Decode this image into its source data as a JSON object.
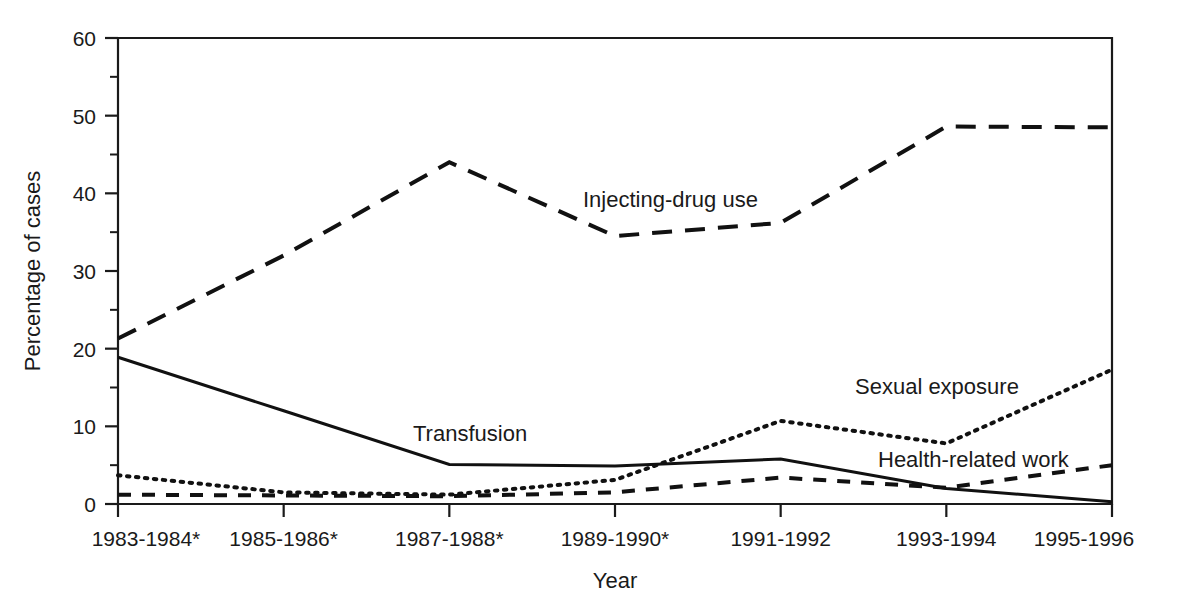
{
  "chart_data": {
    "type": "line",
    "title": "",
    "subtitle": "",
    "xlabel": "Year",
    "ylabel": "Percentage of cases",
    "categories": [
      "1983-1984*",
      "1985-1986*",
      "1987-1988*",
      "1989-1990*",
      "1991-1992",
      "1993-1994",
      "1995-1996"
    ],
    "ylim": [
      0,
      60
    ],
    "xlim_categories": 7,
    "y_ticks_major": [
      0,
      10,
      20,
      30,
      40,
      50,
      60
    ],
    "y_ticks_minor": [
      5,
      15,
      25,
      35,
      45,
      55
    ],
    "y_tick_labels": [
      "0",
      "10",
      "20",
      "30",
      "40",
      "50",
      "60"
    ],
    "grid": false,
    "legend_position": "inline-annotations",
    "footnote_marker": "*",
    "series": [
      {
        "name": "Injecting-drug use",
        "style": "long-dash",
        "color": "#111111",
        "values": [
          21.3,
          32.0,
          44.0,
          34.5,
          36.2,
          48.6,
          48.5
        ],
        "label_x_category_index": 3,
        "label_text": "Injecting-drug use"
      },
      {
        "name": "Transfusion",
        "style": "solid",
        "color": "#111111",
        "values": [
          18.9,
          12.0,
          5.1,
          4.9,
          5.8,
          2.0,
          0.3
        ],
        "label_x_category_index": 2,
        "label_text": "Transfusion"
      },
      {
        "name": "Sexual exposure",
        "style": "dotted",
        "color": "#111111",
        "values": [
          3.7,
          1.5,
          1.2,
          3.1,
          10.7,
          7.8,
          17.3
        ],
        "label_x_category_index": 5,
        "label_text": "Sexual exposure"
      },
      {
        "name": "Health-related work",
        "style": "short-dash",
        "color": "#111111",
        "values": [
          1.2,
          1.1,
          1.0,
          1.5,
          3.4,
          2.1,
          5.0
        ],
        "label_x_category_index": 5,
        "label_text": "Health-related work"
      }
    ],
    "annotations": [
      {
        "text": "Injecting-drug use",
        "x": 583,
        "y": 207
      },
      {
        "text": "Transfusion",
        "x": 413,
        "y": 441
      },
      {
        "text": "Sexual exposure",
        "x": 855,
        "y": 394
      },
      {
        "text": "Health-related work",
        "x": 878,
        "y": 467
      }
    ]
  },
  "labels": {
    "y_axis_title": "Percentage of cases",
    "x_axis_title": "Year"
  }
}
